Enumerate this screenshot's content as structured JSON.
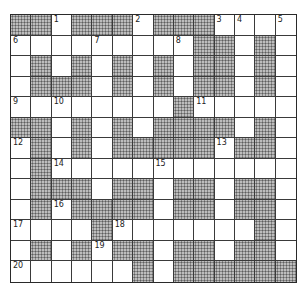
{
  "puzzle": {
    "type": "crossword",
    "columns": 14,
    "rows": 13,
    "colors": {
      "white_cell": "#ffffff",
      "dark_cell": "#9a9a9a",
      "grid_line": "#3a3a3a"
    },
    "layout": [
      "##.###.###....",
      ".........##.#.",
      ".#.#.#.#.##.#.",
      ".###.#.#.##.#.",
      "........#.....",
      "##.#.#.####.#.",
      ".#.#.#####.##.",
      ".#............",
      ".###.##.##.##.",
      ".#.####.##.##.",
      "....#.......#.",
      ".#.#.##.##.##.",
      "......#.######"
    ],
    "numbers": [
      {
        "n": "1",
        "row": 0,
        "col": 2
      },
      {
        "n": "2",
        "row": 0,
        "col": 6
      },
      {
        "n": "3",
        "row": 0,
        "col": 10
      },
      {
        "n": "4",
        "row": 0,
        "col": 11
      },
      {
        "n": "5",
        "row": 0,
        "col": 13
      },
      {
        "n": "6",
        "row": 1,
        "col": 0
      },
      {
        "n": "7",
        "row": 1,
        "col": 4
      },
      {
        "n": "8",
        "row": 1,
        "col": 8
      },
      {
        "n": "9",
        "row": 4,
        "col": 0
      },
      {
        "n": "10",
        "row": 4,
        "col": 2
      },
      {
        "n": "11",
        "row": 4,
        "col": 9
      },
      {
        "n": "12",
        "row": 6,
        "col": 0
      },
      {
        "n": "13",
        "row": 6,
        "col": 10
      },
      {
        "n": "14",
        "row": 7,
        "col": 2
      },
      {
        "n": "15",
        "row": 7,
        "col": 7
      },
      {
        "n": "16",
        "row": 9,
        "col": 2
      },
      {
        "n": "17",
        "row": 10,
        "col": 0
      },
      {
        "n": "18",
        "row": 10,
        "col": 5
      },
      {
        "n": "19",
        "row": 11,
        "col": 4
      },
      {
        "n": "20",
        "row": 12,
        "col": 0
      }
    ]
  }
}
